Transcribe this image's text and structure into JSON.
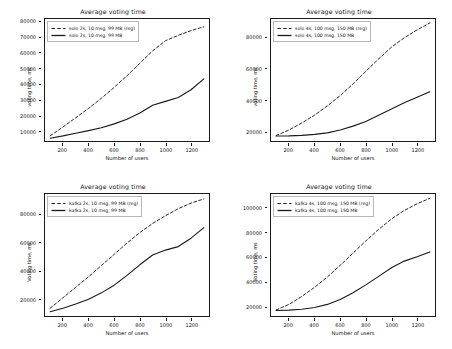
{
  "figure": {
    "width": 452,
    "height": 349,
    "background": "#ffffff",
    "line_color": "#1a1a1a",
    "panel_count": 4
  },
  "common": {
    "title": "Average voting time",
    "xlabel": "Number of users",
    "ylabel": "voting time, ms",
    "ylabel_alt": "Voting time, ms",
    "xticks": [
      200,
      400,
      600,
      800,
      1000,
      1200
    ],
    "reg_suffix": "(reg)"
  },
  "chart_data": [
    {
      "id": "solo-2s-10msg-99mb",
      "position": "top-left",
      "type": "line",
      "title": "Average voting time",
      "xlabel": "Number of users",
      "ylabel": "voting time, ms",
      "xlim": [
        60,
        1340
      ],
      "ylim": [
        3500,
        82000
      ],
      "xticks": [
        200,
        400,
        600,
        800,
        1000,
        1200
      ],
      "yticks": [
        10000,
        20000,
        30000,
        40000,
        50000,
        60000,
        70000,
        80000
      ],
      "ytick_labels": [
        "10000",
        "20000",
        "30000",
        "40000",
        "50000",
        "60000",
        "70000",
        "80000"
      ],
      "grid": false,
      "legend_position": "upper left",
      "x": [
        100,
        200,
        300,
        400,
        500,
        600,
        700,
        800,
        900,
        1000,
        1100,
        1200,
        1300
      ],
      "series": [
        {
          "name": "solo 2s, 10 msg, 99 MB (reg)",
          "style": "dashed",
          "values": [
            6800,
            12500,
            18500,
            24500,
            31000,
            38000,
            45500,
            53500,
            61500,
            68000,
            71500,
            74500,
            77000
          ]
        },
        {
          "name": "solo 2s, 10 msg, 99 MB",
          "style": "solid",
          "values": [
            5300,
            6800,
            8500,
            10200,
            12000,
            14500,
            17500,
            21500,
            26500,
            29000,
            31500,
            36500,
            43500
          ]
        }
      ]
    },
    {
      "id": "solo-4s-100msg-150mb",
      "position": "top-right",
      "type": "line",
      "title": "Average voting time",
      "xlabel": "Number of users",
      "ylabel": "voting time, ms",
      "xlim": [
        60,
        1340
      ],
      "ylim": [
        14000,
        92000
      ],
      "xticks": [
        200,
        400,
        600,
        800,
        1000,
        1200
      ],
      "yticks": [
        20000,
        40000,
        60000,
        80000
      ],
      "ytick_labels": [
        "20000",
        "40000",
        "60000",
        "80000"
      ],
      "grid": false,
      "legend_position": "upper left",
      "x": [
        100,
        200,
        300,
        400,
        500,
        600,
        700,
        800,
        900,
        1000,
        1100,
        1200,
        1300
      ],
      "series": [
        {
          "name": "solo 4s, 100 msg, 150 MB (reg)",
          "style": "dashed",
          "values": [
            17500,
            21000,
            25500,
            30500,
            36500,
            43000,
            50500,
            58500,
            66500,
            74000,
            80000,
            85000,
            89500
          ]
        },
        {
          "name": "solo 4s, 100 msg, 150 MB",
          "style": "solid",
          "values": [
            17200,
            17300,
            17600,
            18200,
            19200,
            21000,
            23500,
            26500,
            30500,
            34500,
            38500,
            42000,
            45500
          ]
        }
      ]
    },
    {
      "id": "kafka-2s-10msg-99mb",
      "position": "bottom-left",
      "type": "line",
      "title": "Average voting time",
      "xlabel": "Number of users",
      "ylabel": "Voting time, ms",
      "xlim": [
        60,
        1340
      ],
      "ylim": [
        8000,
        95000
      ],
      "xticks": [
        200,
        400,
        600,
        800,
        1000,
        1200
      ],
      "yticks": [
        20000,
        40000,
        60000,
        80000
      ],
      "ytick_labels": [
        "20000",
        "40000",
        "60000",
        "80000"
      ],
      "grid": false,
      "legend_position": "upper left",
      "x": [
        100,
        200,
        300,
        400,
        500,
        600,
        700,
        800,
        900,
        1000,
        1100,
        1200,
        1300
      ],
      "series": [
        {
          "name": "kafka 2s, 10 msg, 99 MB (reg)",
          "style": "dashed",
          "values": [
            13500,
            21000,
            28500,
            36000,
            44000,
            52000,
            60000,
            67500,
            74000,
            79500,
            84500,
            88500,
            91500
          ]
        },
        {
          "name": "kafka 2s, 10 msg, 99 MB",
          "style": "solid",
          "values": [
            11000,
            13500,
            16500,
            20000,
            24500,
            30000,
            37000,
            44500,
            51500,
            55000,
            57500,
            63500,
            71000
          ]
        }
      ]
    },
    {
      "id": "kafka-4s-100msg-150mb",
      "position": "bottom-right",
      "type": "line",
      "title": "Average voting time",
      "xlabel": "Number of users",
      "ylabel": "Voting time, ms",
      "xlim": [
        60,
        1340
      ],
      "ylim": [
        12000,
        112000
      ],
      "xticks": [
        200,
        400,
        600,
        800,
        1000,
        1200
      ],
      "yticks": [
        20000,
        40000,
        60000,
        80000,
        100000
      ],
      "ytick_labels": [
        "20000",
        "40000",
        "60000",
        "80000",
        "100000"
      ],
      "grid": false,
      "legend_position": "upper left",
      "x": [
        100,
        200,
        300,
        400,
        500,
        600,
        700,
        800,
        900,
        1000,
        1100,
        1200,
        1300
      ],
      "series": [
        {
          "name": "kafka 4s, 100 msg, 150 MB (reg)",
          "style": "dashed",
          "values": [
            17000,
            21500,
            28000,
            35500,
            44000,
            53500,
            63500,
            73500,
            83000,
            91500,
            98500,
            104000,
            108500
          ]
        },
        {
          "name": "kafka 4s, 100 msg, 150 MB",
          "style": "solid",
          "values": [
            16500,
            16800,
            17500,
            19000,
            21500,
            25500,
            31000,
            37500,
            44500,
            51500,
            57000,
            60500,
            64500
          ]
        }
      ]
    }
  ]
}
